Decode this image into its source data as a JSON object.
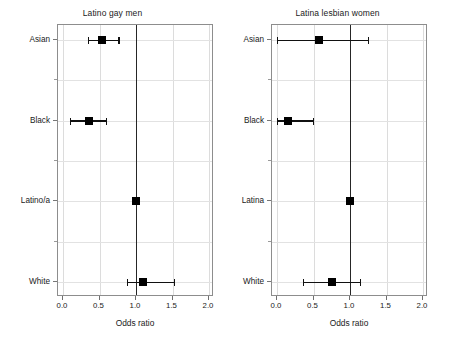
{
  "figure": {
    "type": "forest-plot",
    "background": "#ffffff",
    "marker_color": "#000000",
    "reference_line_color": "#262626",
    "grid_color": "#dcdcdc"
  },
  "chart_data": [
    {
      "type": "scatter",
      "subtype": "forest-plot",
      "title": "Latino gay men",
      "xlabel": "Odds ratio",
      "ylabel": "",
      "xlim": [
        0.0,
        2.0
      ],
      "xticks": [
        0.0,
        0.5,
        1.0,
        1.5,
        2.0
      ],
      "xticklabels": [
        "0.0",
        "0.5",
        "1.0",
        "1.5",
        "2.0"
      ],
      "categories": [
        "Asian",
        "Black",
        "Latino/a",
        "White"
      ],
      "reference_line": 1.0,
      "grid": true,
      "legend": "none",
      "points": [
        {
          "label": "Asian",
          "odds_ratio": 0.54,
          "ci_low": 0.34,
          "ci_high": 0.76,
          "is_reference": false
        },
        {
          "label": "Black",
          "odds_ratio": 0.35,
          "ci_low": 0.1,
          "ci_high": 0.59,
          "is_reference": false
        },
        {
          "label": "Latino/a",
          "odds_ratio": 1.0,
          "ci_low": 1.0,
          "ci_high": 1.0,
          "is_reference": true
        },
        {
          "label": "White",
          "odds_ratio": 1.1,
          "ci_low": 0.87,
          "ci_high": 1.52,
          "is_reference": false
        }
      ]
    },
    {
      "type": "scatter",
      "subtype": "forest-plot",
      "title": "Latina lesbian women",
      "xlabel": "Odds ratio",
      "ylabel": "",
      "xlim": [
        0.0,
        2.0
      ],
      "xticks": [
        0.0,
        0.5,
        1.0,
        1.5,
        2.0
      ],
      "xticklabels": [
        "0.0",
        "0.5",
        "1.0",
        "1.5",
        "2.0"
      ],
      "categories": [
        "Asian",
        "Black",
        "Latina",
        "White"
      ],
      "reference_line": 1.0,
      "grid": true,
      "legend": "none",
      "points": [
        {
          "label": "Asian",
          "odds_ratio": 0.58,
          "ci_low": 0.0,
          "ci_high": 1.24,
          "is_reference": false
        },
        {
          "label": "Black",
          "odds_ratio": 0.15,
          "ci_low": 0.0,
          "ci_high": 0.49,
          "is_reference": false
        },
        {
          "label": "Latina",
          "odds_ratio": 1.0,
          "ci_low": 1.0,
          "ci_high": 1.0,
          "is_reference": true
        },
        {
          "label": "White",
          "odds_ratio": 0.75,
          "ci_low": 0.35,
          "ci_high": 1.14,
          "is_reference": false
        }
      ]
    }
  ]
}
